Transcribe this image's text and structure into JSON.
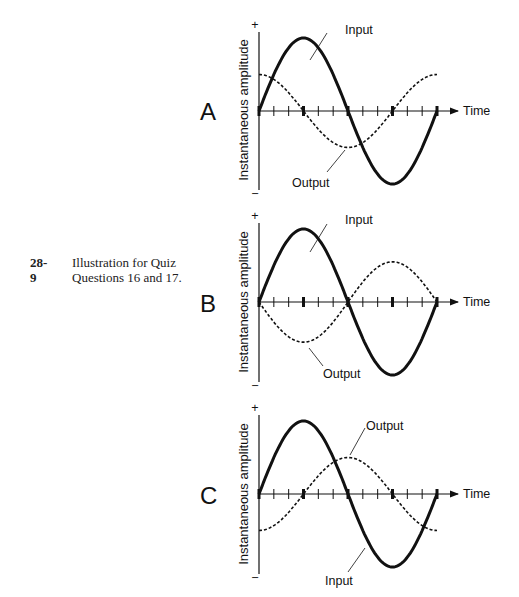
{
  "caption": {
    "number": "28-9",
    "text": "Illustration for Quiz Questions 16 and 17."
  },
  "chart_data": [
    {
      "type": "line",
      "panel": "A",
      "ylabel": "Instantaneous amplitude",
      "xlabel": "Time",
      "y_pos_symbol": "+",
      "y_neg_symbol": "−",
      "x_phase_ticks": [
        "0",
        "90°",
        "180°",
        "270°",
        "360°"
      ],
      "series": [
        {
          "name": "Input",
          "style": "solid",
          "function": "sin",
          "amplitude": 1.0,
          "phase_deg": 0
        },
        {
          "name": "Output",
          "style": "dashed",
          "function": "cos",
          "amplitude": 0.5,
          "phase_deg": 90
        }
      ],
      "annotations": [
        {
          "text": "Input",
          "target": "Input"
        },
        {
          "text": "Output",
          "target": "Output"
        }
      ]
    },
    {
      "type": "line",
      "panel": "B",
      "ylabel": "Instantaneous amplitude",
      "xlabel": "Time",
      "y_pos_symbol": "+",
      "y_neg_symbol": "−",
      "x_phase_ticks": [
        "0",
        "90°",
        "180°",
        "270°",
        "360°"
      ],
      "series": [
        {
          "name": "Input",
          "style": "solid",
          "function": "sin",
          "amplitude": 1.0,
          "phase_deg": 0
        },
        {
          "name": "Output",
          "style": "dashed",
          "function": "-sin",
          "amplitude": 0.55,
          "phase_deg": 180
        }
      ],
      "annotations": [
        {
          "text": "Input",
          "target": "Input"
        },
        {
          "text": "Output",
          "target": "Output"
        }
      ]
    },
    {
      "type": "line",
      "panel": "C",
      "ylabel": "Instantaneous amplitude",
      "xlabel": "Time",
      "y_pos_symbol": "+",
      "y_neg_symbol": "−",
      "x_phase_ticks": [
        "0",
        "90°",
        "180°",
        "270°",
        "360°"
      ],
      "series": [
        {
          "name": "Input",
          "style": "solid",
          "function": "sin",
          "amplitude": 1.0,
          "phase_deg": 0
        },
        {
          "name": "Output",
          "style": "dashed",
          "function": "-cos",
          "amplitude": 0.5,
          "phase_deg": -90
        }
      ],
      "annotations": [
        {
          "text": "Output",
          "target": "Output"
        },
        {
          "text": "Input",
          "target": "Input"
        }
      ]
    }
  ],
  "panels": [
    {
      "letter": "A",
      "ylabel": "Instantaneous amplitude",
      "xlabel": "Time",
      "plus": "+",
      "minus": "−",
      "label1": "Input",
      "label2": "Output"
    },
    {
      "letter": "B",
      "ylabel": "Instantaneous amplitude",
      "xlabel": "Time",
      "plus": "+",
      "minus": "−",
      "label1": "Input",
      "label2": "Output"
    },
    {
      "letter": "C",
      "ylabel": "Instantaneous amplitude",
      "xlabel": "Time",
      "plus": "+",
      "minus": "−",
      "label1": "Output",
      "label2": "Input"
    }
  ]
}
